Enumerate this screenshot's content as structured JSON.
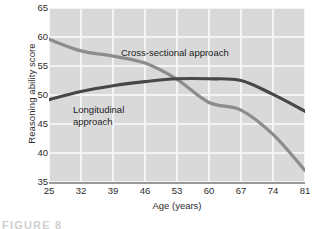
{
  "chart_data": {
    "type": "line",
    "title": "",
    "xlabel": "Age (years)",
    "ylabel": "Reasoning ability score",
    "xlim": [
      25,
      81
    ],
    "ylim": [
      35,
      65
    ],
    "xticks": [
      25,
      32,
      39,
      46,
      53,
      60,
      67,
      74,
      81
    ],
    "yticks": [
      65,
      60,
      55,
      50,
      45,
      40,
      35
    ],
    "grid": true,
    "legend_position": "inline-annotation",
    "x": [
      25,
      32,
      39,
      46,
      53,
      60,
      67,
      74,
      81
    ],
    "series": [
      {
        "name": "Cross-sectional approach",
        "color": "#8c8c8c",
        "values": [
          59.6,
          57.6,
          56.7,
          55.5,
          52.7,
          48.7,
          47.4,
          43.2,
          37.0
        ]
      },
      {
        "name": "Longitudinal approach",
        "color": "#474747",
        "values": [
          49.2,
          50.6,
          51.6,
          52.3,
          52.8,
          52.8,
          52.5,
          50.1,
          47.2
        ]
      }
    ],
    "annotations": [
      {
        "text": "Cross-sectional approach",
        "series": "Cross-sectional approach"
      },
      {
        "text": "Longitudinal\napproach",
        "series": "Longitudinal approach"
      }
    ],
    "plot_background": "#d9d9d9",
    "gridline_color": "#f4f4f4"
  },
  "axes": {
    "y_title": "Reasoning ability score",
    "x_title": "Age (years)",
    "y_tick_labels": [
      "65",
      "60",
      "55",
      "50",
      "45",
      "40",
      "35"
    ],
    "x_tick_labels": [
      "25",
      "32",
      "39",
      "46",
      "53",
      "60",
      "67",
      "74",
      "81"
    ]
  },
  "annotations": {
    "cross_sectional": "Cross-sectional approach",
    "longitudinal_line1": "Longitudinal",
    "longitudinal_line2": "approach"
  },
  "caption": {
    "text": "FIGURE 8"
  }
}
